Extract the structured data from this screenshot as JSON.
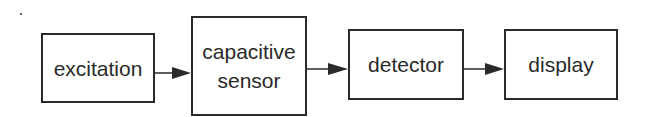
{
  "diagram": {
    "type": "block-diagram",
    "blocks": [
      {
        "id": "excitation",
        "label": "excitation"
      },
      {
        "id": "capacitive-sensor",
        "label": "capacitive sensor",
        "lines": [
          "capacitive",
          "sensor"
        ]
      },
      {
        "id": "detector",
        "label": "detector"
      },
      {
        "id": "display",
        "label": "display"
      }
    ],
    "edges": [
      {
        "from": "excitation",
        "to": "capacitive-sensor"
      },
      {
        "from": "capacitive-sensor",
        "to": "detector"
      },
      {
        "from": "detector",
        "to": "display"
      }
    ]
  }
}
